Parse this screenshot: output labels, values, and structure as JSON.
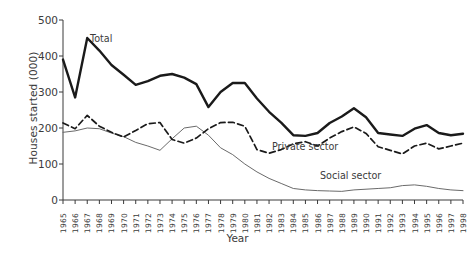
{
  "chart_data": {
    "type": "line",
    "title": "",
    "xlabel": "Year",
    "ylabel": "Houses started (000)",
    "xlim": [
      1965,
      1998
    ],
    "ylim": [
      0,
      500
    ],
    "yticks": [
      0,
      100,
      200,
      300,
      400,
      500
    ],
    "grid": false,
    "legend_position": "inline-annotations",
    "x": [
      1965,
      1966,
      1967,
      1968,
      1969,
      1970,
      1971,
      1972,
      1973,
      1974,
      1975,
      1976,
      1977,
      1978,
      1979,
      1980,
      1981,
      1982,
      1983,
      1984,
      1985,
      1986,
      1987,
      1988,
      1989,
      1990,
      1991,
      1992,
      1993,
      1994,
      1995,
      1996,
      1997,
      1998
    ],
    "categories": [
      "1965",
      "1966",
      "1967",
      "1968",
      "1969",
      "1970",
      "1971",
      "1972",
      "1973",
      "1974",
      "1975",
      "1976",
      "1977",
      "1978",
      "1979",
      "1980",
      "1981",
      "1982",
      "1983",
      "1984",
      "1985",
      "1986",
      "1987",
      "1988",
      "1989",
      "1990",
      "1991",
      "1992",
      "1993",
      "1994",
      "1995",
      "1996",
      "1997",
      "1998"
    ],
    "series": [
      {
        "name": "Total",
        "style": "solid-thick",
        "color": "#1a1a1a",
        "values": [
          390,
          285,
          450,
          415,
          375,
          348,
          320,
          330,
          345,
          350,
          340,
          322,
          258,
          300,
          325,
          325,
          282,
          245,
          215,
          180,
          178,
          186,
          214,
          232,
          255,
          230,
          186,
          182,
          178,
          198,
          208,
          186,
          180,
          184
        ]
      },
      {
        "name": "Private sector",
        "style": "dashed",
        "color": "#1a1a1a",
        "values": [
          214,
          198,
          235,
          205,
          188,
          175,
          193,
          212,
          215,
          168,
          158,
          172,
          198,
          215,
          216,
          205,
          140,
          130,
          140,
          156,
          162,
          150,
          172,
          190,
          203,
          185,
          148,
          138,
          128,
          150,
          158,
          142,
          150,
          158
        ]
      },
      {
        "name": "Social sector",
        "style": "solid-thin",
        "color": "#6a6a6a",
        "values": [
          188,
          192,
          200,
          198,
          186,
          176,
          160,
          150,
          138,
          170,
          200,
          205,
          180,
          145,
          126,
          100,
          78,
          60,
          46,
          32,
          28,
          26,
          25,
          24,
          28,
          30,
          32,
          34,
          40,
          42,
          38,
          32,
          28,
          26
        ]
      }
    ],
    "annotations": [
      {
        "text": "Total",
        "series": "Total"
      },
      {
        "text": "Private sector",
        "series": "Private sector"
      },
      {
        "text": "Social sector",
        "series": "Social sector"
      }
    ]
  }
}
